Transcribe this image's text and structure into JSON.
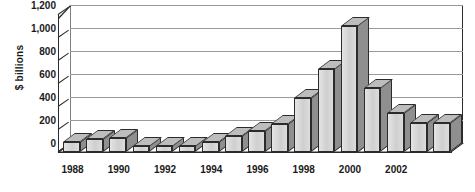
{
  "chart_data": {
    "type": "bar",
    "title": "",
    "subtitle": "",
    "xlabel": "",
    "ylabel": "$ billions",
    "ylim": [
      0,
      1200
    ],
    "ytick_values": [
      0,
      200,
      400,
      600,
      800,
      1000,
      1200
    ],
    "ytick_labels": [
      "0",
      "200",
      "400",
      "600",
      "800",
      "1,000",
      "1,200"
    ],
    "grid": true,
    "legend": "none",
    "style": "3d-column",
    "categories": [
      "1988",
      "1989",
      "1990",
      "1991",
      "1992",
      "1993",
      "1994",
      "1995",
      "1996",
      "1997",
      "1998",
      "1999",
      "2000",
      "2001",
      "2002",
      "2003",
      "2004"
    ],
    "xtick_labels_shown": [
      "1988",
      "1990",
      "1992",
      "1994",
      "1996",
      "1998",
      "2000",
      "2002"
    ],
    "values": [
      90,
      110,
      120,
      55,
      55,
      50,
      90,
      140,
      180,
      240,
      470,
      720,
      1100,
      560,
      340,
      250,
      250
    ],
    "series": [
      {
        "name": "",
        "values": [
          90,
          110,
          120,
          55,
          55,
          50,
          90,
          140,
          180,
          240,
          470,
          720,
          1100,
          560,
          340,
          250,
          250
        ]
      }
    ],
    "colors": {
      "bar_front": "#d4d4d4",
      "bar_side": "#8f8f8f",
      "bar_top": "#bdbdbd",
      "axis": "#2b2b2b",
      "gridline": "#9a9a9a",
      "background": "#ffffff",
      "text": "#1a1a1a"
    }
  }
}
